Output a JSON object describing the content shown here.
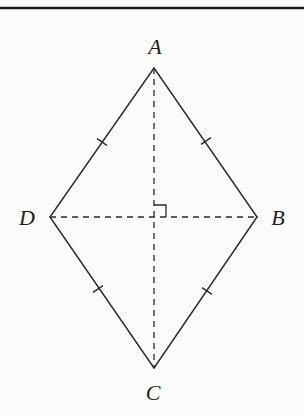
{
  "diagram": {
    "type": "rhombus",
    "colors": {
      "background": "#fbfbfa",
      "stroke": "#2a2a2a",
      "top_rule": "#1a1a1a"
    },
    "top_rule": {
      "x1": 0,
      "x2": 304,
      "y": 8
    },
    "vertices": [
      {
        "id": "A",
        "label": "A",
        "x": 154,
        "y": 68,
        "label_x": 155,
        "label_y": 54
      },
      {
        "id": "B",
        "label": "B",
        "x": 257,
        "y": 217,
        "label_x": 278,
        "label_y": 225
      },
      {
        "id": "C",
        "label": "C",
        "x": 154,
        "y": 368,
        "label_x": 153,
        "label_y": 400
      },
      {
        "id": "D",
        "label": "D",
        "x": 50,
        "y": 217,
        "label_x": 27,
        "label_y": 225
      }
    ],
    "sides": [
      "AB",
      "BC",
      "CD",
      "DA"
    ],
    "diagonals": [
      "AC",
      "DB"
    ],
    "diagonal_style": "dashed",
    "equal_side_ticks": [
      {
        "side": "DA",
        "x": 102,
        "y": 142
      },
      {
        "side": "AB",
        "x": 206,
        "y": 141
      },
      {
        "side": "CD",
        "x": 98,
        "y": 289
      },
      {
        "side": "BC",
        "x": 207,
        "y": 291
      }
    ],
    "right_angle_marker": {
      "at": "intersection",
      "x": 154,
      "y": 217,
      "size": 12,
      "quadrant": "upper-right"
    }
  }
}
